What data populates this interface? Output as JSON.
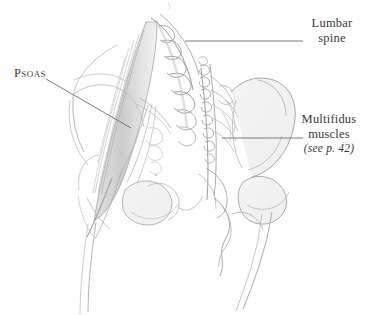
{
  "figure": {
    "title_visible": false,
    "background_color": "#fefefe",
    "medium": "pencil-sketch"
  },
  "labels": {
    "lumbar_spine": {
      "line1": "Lumbar",
      "line2": "spine"
    },
    "multifidus": {
      "line1": "Multifidus",
      "line2": "muscles",
      "line3": "(see p. 42)"
    },
    "psoas": {
      "text": "Psoas"
    }
  },
  "colors": {
    "text": "#3a3a3a",
    "leader_line": "#6e6e6e",
    "sketch_outline": "#9a9a9a",
    "sketch_shadow": "#b8b8b8",
    "background": "#fefefe"
  },
  "leaders": {
    "lumbar_spine": {
      "x1": 185,
      "y1": 41,
      "x2": 303,
      "y2": 41
    },
    "multifidus": {
      "x1": 222,
      "y1": 138,
      "x2": 303,
      "y2": 138
    },
    "psoas": {
      "x1": 46,
      "y1": 79,
      "x2": 131,
      "y2": 128
    }
  }
}
